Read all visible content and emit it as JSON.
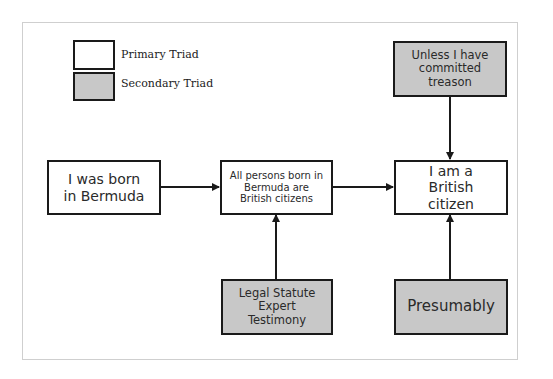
{
  "legend": {
    "items": [
      {
        "label": "Primary Triad",
        "fill": "#ffffff"
      },
      {
        "label": "Secondary Triad",
        "fill": "#c8c8c8"
      }
    ]
  },
  "nodes": {
    "born": {
      "text": "I was born in Bermuda",
      "type": "primary"
    },
    "statute": {
      "text": "All persons born in Bermuda are British citizens",
      "type": "primary"
    },
    "claim": {
      "text": "I am a British citizen",
      "type": "primary"
    },
    "rebuttal": {
      "text": "Unless I have committed treason",
      "type": "secondary"
    },
    "backing": {
      "text": "Legal Statute Expert Testimony",
      "type": "secondary"
    },
    "qualifier": {
      "text": "Presumably",
      "type": "secondary"
    }
  },
  "edges": [
    {
      "from": "born",
      "to": "statute"
    },
    {
      "from": "statute",
      "to": "claim"
    },
    {
      "from": "rebuttal",
      "to": "claim"
    },
    {
      "from": "backing",
      "to": "statute"
    },
    {
      "from": "qualifier",
      "to": "claim"
    }
  ],
  "colors": {
    "primary_fill": "#ffffff",
    "secondary_fill": "#c8c8c8",
    "stroke": "#1a1a1a",
    "frame": "#cfcfcf"
  }
}
